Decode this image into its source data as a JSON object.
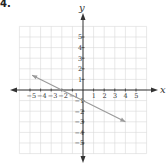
{
  "problem_label": "4.",
  "chart_data": {
    "type": "line",
    "title": "",
    "xlabel": "x",
    "ylabel": "y",
    "xlim": [
      -6,
      6
    ],
    "ylim": [
      -6,
      6
    ],
    "grid": true,
    "x_ticks": [
      -5,
      -4,
      -3,
      -2,
      -1,
      1,
      2,
      3,
      4,
      5
    ],
    "y_ticks": [
      5,
      4,
      3,
      2,
      1,
      -1,
      -2,
      -3,
      -4,
      -5
    ],
    "series": [
      {
        "name": "line",
        "equation": "y = -1/2 x - 1",
        "slope": -0.5,
        "y_intercept": -1,
        "x_intercept": -2,
        "x": [
          -4.8,
          4
        ],
        "y": [
          1.4,
          -3
        ],
        "arrows": "both",
        "color": "#9a9a9a"
      }
    ]
  },
  "colors": {
    "grid": "#d8d8d8",
    "axis": "#333333",
    "line": "#9a9a9a"
  }
}
